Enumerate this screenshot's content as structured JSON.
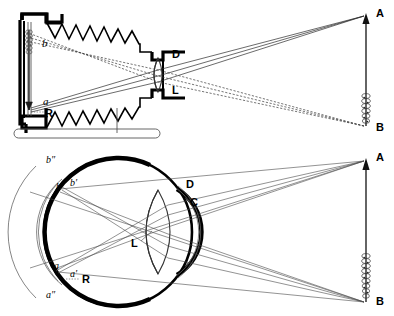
{
  "figure": {
    "background_color": "#ffffff",
    "ink_color": "#000000"
  },
  "panels": [
    {
      "id": "camera",
      "name": "camera-panel",
      "caption": "",
      "labels": [
        {
          "key": "b",
          "text": "b",
          "style": "italic",
          "x": 42,
          "y": 47
        },
        {
          "key": "a",
          "text": "a",
          "style": "italic",
          "x": 43,
          "y": 105
        },
        {
          "key": "R",
          "text": "R",
          "style": "bold",
          "x": 45,
          "y": 117
        },
        {
          "key": "D",
          "text": "D",
          "style": "bold",
          "x": 172,
          "y": 58
        },
        {
          "key": "L",
          "text": "L",
          "style": "bold",
          "x": 172,
          "y": 94
        },
        {
          "key": "A",
          "text": "A",
          "style": "bold",
          "x": 376,
          "y": 17
        },
        {
          "key": "B",
          "text": "B",
          "style": "bold",
          "x": 376,
          "y": 131
        }
      ]
    },
    {
      "id": "eye",
      "name": "eye-panel",
      "caption": "",
      "labels": [
        {
          "key": "b2",
          "text": "b″",
          "style": "italic",
          "x": 46,
          "y": 163
        },
        {
          "key": "b1",
          "text": "b′",
          "style": "italic",
          "x": 70,
          "y": 186
        },
        {
          "key": "b",
          "text": "b",
          "style": "italic",
          "x": 56,
          "y": 190
        },
        {
          "key": "a",
          "text": "a",
          "style": "italic",
          "x": 54,
          "y": 269
        },
        {
          "key": "a1",
          "text": "a′",
          "style": "italic",
          "x": 70,
          "y": 277
        },
        {
          "key": "a2",
          "text": "a″",
          "style": "italic",
          "x": 46,
          "y": 298
        },
        {
          "key": "R",
          "text": "R",
          "style": "bold",
          "x": 82,
          "y": 283
        },
        {
          "key": "D",
          "text": "D",
          "style": "bold",
          "x": 186,
          "y": 188
        },
        {
          "key": "C",
          "text": "C",
          "style": "bold",
          "x": 190,
          "y": 206
        },
        {
          "key": "L",
          "text": "L",
          "style": "bold",
          "x": 137,
          "y": 244
        },
        {
          "key": "A",
          "text": "A",
          "style": "bold",
          "x": 376,
          "y": 161
        },
        {
          "key": "B",
          "text": "B",
          "style": "bold",
          "x": 376,
          "y": 305
        }
      ]
    }
  ],
  "object_arrow": {
    "name": "object-arrow",
    "top_label": "A",
    "bottom_label": "B",
    "description": "upright arrow object with textured candle-flame base"
  },
  "legend": {
    "solid_rays": "rays from point A",
    "dashed_rays": "rays from point B"
  },
  "components": {
    "camera_screen": "R",
    "camera_diaphragm": "D",
    "camera_lens": "L",
    "eye_retina": "R",
    "eye_cornea": "D",
    "eye_aqueous": "C",
    "eye_crystalline_lens": "L"
  }
}
